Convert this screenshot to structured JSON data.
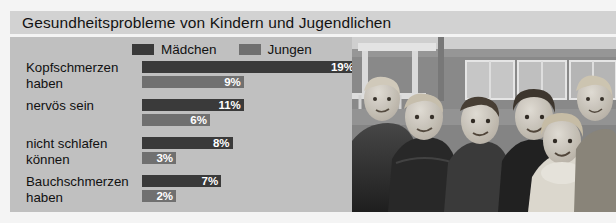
{
  "title": "Gesundheitsprobleme von Kindern und Jugendlichen",
  "colors": {
    "panel_bg": "#c0c0c0",
    "title_bg": "#d2d2d2",
    "page_bg": "#f4f4f4",
    "series_maedchen": "#3a3a3a",
    "series_jungen": "#707070",
    "value_text": "#ffffff",
    "label_text": "#111111"
  },
  "legend": {
    "items": [
      {
        "label": "Mädchen",
        "color": "#3a3a3a"
      },
      {
        "label": "Jungen",
        "color": "#707070"
      }
    ]
  },
  "photo": {
    "alt": "Gruppe von sechs Kindern vor einem Gebäude",
    "style": "grayscale-photograph"
  },
  "rows": [
    {
      "label": "Kopfschmerzen\nhaben",
      "maedchen": {
        "value": 19,
        "text": "19%"
      },
      "jungen": {
        "value": 9,
        "text": "9%"
      }
    },
    {
      "label": "nervös sein",
      "maedchen": {
        "value": 11,
        "text": "11%"
      },
      "jungen": {
        "value": 6,
        "text": "6%"
      }
    },
    {
      "label": "nicht schlafen\nkönnen",
      "maedchen": {
        "value": 8,
        "text": "8%"
      },
      "jungen": {
        "value": 3,
        "text": "3%"
      }
    },
    {
      "label": "Bauchschmerzen\nhaben",
      "maedchen": {
        "value": 7,
        "text": "7%"
      },
      "jungen": {
        "value": 2,
        "text": "2%"
      }
    }
  ],
  "chart_data": {
    "type": "bar",
    "orientation": "horizontal",
    "title": "Gesundheitsprobleme von Kindern und Jugendlichen",
    "xlabel": "",
    "ylabel": "",
    "categories": [
      "Kopfschmerzen haben",
      "nervös sein",
      "nicht schlafen können",
      "Bauchschmerzen haben"
    ],
    "series": [
      {
        "name": "Mädchen",
        "color": "#3a3a3a",
        "values": [
          19,
          9,
          8,
          7
        ],
        "unit": "%"
      },
      {
        "name": "Jungen",
        "color": "#707070",
        "values": [
          9,
          6,
          3,
          2
        ],
        "unit": "%"
      }
    ],
    "xlim": [
      0,
      19
    ],
    "grid": false,
    "legend_position": "top",
    "data_labels": true,
    "value_suffix": "%"
  }
}
